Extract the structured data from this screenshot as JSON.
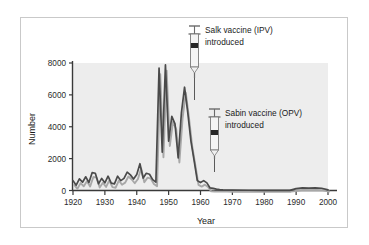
{
  "chart_data": {
    "type": "line",
    "title": "",
    "xlabel": "Year",
    "ylabel": "Number",
    "xlim": [
      1920,
      2000
    ],
    "ylim": [
      0,
      8000
    ],
    "xticks": [
      1920,
      1930,
      1940,
      1950,
      1960,
      1970,
      1980,
      1990,
      2000
    ],
    "yticks": [
      0,
      2000,
      4000,
      6000,
      8000
    ],
    "grid": false,
    "legend_position": "none",
    "plot_background": "#ededed",
    "series": [
      {
        "name": "primary-line",
        "color": "#4a4a4a",
        "x": [
          1920,
          1921,
          1922,
          1923,
          1924,
          1925,
          1926,
          1927,
          1928,
          1929,
          1930,
          1931,
          1932,
          1933,
          1934,
          1935,
          1936,
          1937,
          1938,
          1939,
          1940,
          1941,
          1942,
          1943,
          1944,
          1945,
          1946,
          1947,
          1948,
          1949,
          1950,
          1951,
          1952,
          1953,
          1954,
          1955,
          1956,
          1957,
          1958,
          1959,
          1960,
          1961,
          1962,
          1963,
          1964,
          1965,
          1966,
          1967,
          1968,
          1970,
          1975,
          1980,
          1985,
          1988,
          1990,
          1992,
          1994,
          1996,
          1998,
          2000
        ],
        "values": [
          620,
          330,
          730,
          520,
          860,
          500,
          1120,
          1080,
          420,
          760,
          480,
          900,
          460,
          420,
          900,
          620,
          760,
          1150,
          980,
          720,
          1000,
          1680,
          780,
          1080,
          1020,
          680,
          520,
          7680,
          2400,
          7880,
          3100,
          4650,
          4180,
          2050,
          4850,
          6480,
          4900,
          3100,
          1880,
          620,
          500,
          620,
          480,
          160,
          130,
          90,
          60,
          40,
          30,
          20,
          15,
          12,
          10,
          8,
          120,
          170,
          150,
          160,
          140,
          40
        ]
      },
      {
        "name": "shadow-line",
        "color": "#a8a8a8",
        "x": [
          1920,
          1921,
          1922,
          1923,
          1924,
          1925,
          1926,
          1927,
          1928,
          1929,
          1930,
          1931,
          1932,
          1933,
          1934,
          1935,
          1936,
          1937,
          1938,
          1939,
          1940,
          1941,
          1942,
          1943,
          1944,
          1945,
          1946,
          1947,
          1948,
          1949,
          1950,
          1951,
          1952,
          1953,
          1954,
          1955,
          1956,
          1957,
          1958,
          1959,
          1960,
          1961,
          1962,
          1963,
          1964,
          1965,
          1966,
          1967,
          1968,
          1970,
          1975,
          1980,
          1985,
          1988,
          1990,
          1992,
          1994,
          1996,
          1998,
          2000
        ],
        "values": [
          420,
          180,
          540,
          340,
          660,
          330,
          920,
          880,
          260,
          560,
          300,
          700,
          290,
          250,
          700,
          440,
          570,
          950,
          780,
          530,
          800,
          1460,
          590,
          880,
          820,
          490,
          340,
          7380,
          2160,
          7600,
          2870,
          4400,
          3930,
          1830,
          4600,
          6220,
          4650,
          2880,
          1670,
          430,
          320,
          440,
          300,
          20,
          10,
          5,
          4,
          3,
          2,
          1,
          1,
          1,
          1,
          1,
          60,
          110,
          95,
          105,
          85,
          10
        ]
      }
    ],
    "annotations": [
      {
        "id": "salk",
        "icon": "syringe-icon",
        "line1": "Salk vaccine (IPV)",
        "line2": "introduced",
        "points_to_year": 1955
      },
      {
        "id": "sabin",
        "icon": "syringe-icon",
        "line1": "Sabin vaccine (OPV)",
        "line2": "introduced",
        "points_to_year": 1962
      }
    ]
  },
  "axes": {
    "ylabel": "Number",
    "xlabel": "Year",
    "ytick_labels": [
      "0",
      "2000",
      "4000",
      "6000",
      "8000"
    ],
    "xtick_labels": [
      "1920",
      "1930",
      "1940",
      "1950",
      "1960",
      "1970",
      "1980",
      "1990",
      "2000"
    ]
  },
  "annotations": {
    "salk": {
      "line1": "Salk vaccine (IPV)",
      "line2": "introduced"
    },
    "sabin": {
      "line1": "Sabin vaccine (OPV)",
      "line2": "introduced"
    }
  },
  "colors": {
    "primary_line": "#4a4a4a",
    "shadow_line": "#a8a8a8",
    "plot_bg": "#ededed",
    "axis": "#3a3a3a",
    "frame": "#c9c9c9",
    "text": "#1a1a1a"
  }
}
